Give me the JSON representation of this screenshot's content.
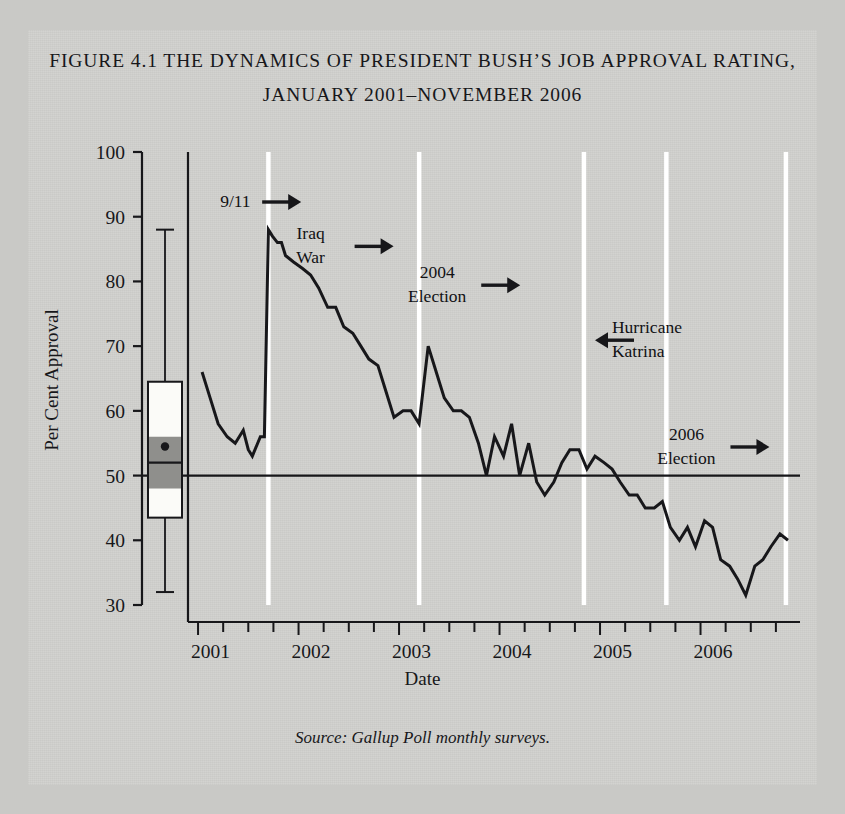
{
  "figure": {
    "title_line_1": "FIGURE 4.1 THE DYNAMICS OF PRESIDENT BUSH’S JOB APPROVAL RATING,",
    "title_line_2": "JANUARY 2001–NOVEMBER 2006",
    "axis_title": "Date",
    "source_note": "Source: Gallup Poll monthly surveys.",
    "background_color": "#d2d2cf",
    "ink_color": "#17171a"
  },
  "chart_data": {
    "type": "line",
    "title": "FIGURE 4.1 THE DYNAMICS OF PRESIDENT BUSH’S JOB APPROVAL RATING, JANUARY 2001–NOVEMBER 2006",
    "xlabel": "Date",
    "ylabel": "Per Cent Approval",
    "ylim": [
      30,
      100
    ],
    "yticks": [
      30,
      40,
      50,
      60,
      70,
      80,
      90,
      100
    ],
    "xlim": [
      2000.9,
      2006.95
    ],
    "xticks": [
      2001,
      2002,
      2003,
      2004,
      2005,
      2006
    ],
    "xtick_labels": [
      "2001",
      "2002",
      "2003",
      "2004",
      "2005",
      "2006"
    ],
    "minor_tick_interval_years": 0.25,
    "grid": false,
    "legend": null,
    "reference_lines": [
      {
        "name": "fifty-per-cent-line",
        "orientation": "horizontal",
        "value": 50,
        "color": "#17171a"
      }
    ],
    "event_gridlines": [
      {
        "label": "9/11",
        "x": 2001.7,
        "color": "#ffffff"
      },
      {
        "label": "Iraq War",
        "x": 2003.2,
        "color": "#ffffff"
      },
      {
        "label": "2004 Election",
        "x": 2004.84,
        "color": "#ffffff"
      },
      {
        "label": "Hurricane Katrina",
        "x": 2005.66,
        "color": "#ffffff"
      },
      {
        "label": "2006 Election",
        "x": 2006.85,
        "color": "#ffffff"
      }
    ],
    "annotations": [
      {
        "name": "annotation-9-11",
        "lines": [
          "9/11"
        ],
        "arrow": "right",
        "text_x": 2001.22,
        "text_y": 91.5
      },
      {
        "name": "annotation-iraq-war",
        "lines": [
          "Iraq",
          "War"
        ],
        "arrow": "right",
        "text_x": 2002.12,
        "text_y": 86.5
      },
      {
        "name": "annotation-2004-election",
        "lines": [
          "2004",
          "Election"
        ],
        "arrow": "right",
        "text_x": 2003.38,
        "text_y": 80.5
      },
      {
        "name": "annotation-hurricane-katrina",
        "lines": [
          "Hurricane",
          "Katrina"
        ],
        "arrow": "left",
        "text_x": 2004.9,
        "text_y": 72.0
      },
      {
        "name": "annotation-2006-election",
        "lines": [
          "2006",
          "Election"
        ],
        "arrow": "right",
        "text_x": 2005.86,
        "text_y": 55.5
      }
    ],
    "series": [
      {
        "name": "Gallup job approval",
        "color": "#17171a",
        "x": [
          2001.04,
          2001.12,
          2001.2,
          2001.29,
          2001.37,
          2001.45,
          2001.5,
          2001.54,
          2001.62,
          2001.66,
          2001.7,
          2001.74,
          2001.79,
          2001.83,
          2001.87,
          2001.95,
          2002.04,
          2002.12,
          2002.2,
          2002.29,
          2002.37,
          2002.45,
          2002.54,
          2002.62,
          2002.7,
          2002.79,
          2002.87,
          2002.95,
          2003.04,
          2003.12,
          2003.2,
          2003.29,
          2003.37,
          2003.45,
          2003.54,
          2003.62,
          2003.7,
          2003.79,
          2003.87,
          2003.95,
          2004.04,
          2004.12,
          2004.2,
          2004.29,
          2004.37,
          2004.45,
          2004.54,
          2004.62,
          2004.7,
          2004.79,
          2004.87,
          2004.95,
          2005.04,
          2005.12,
          2005.2,
          2005.29,
          2005.37,
          2005.45,
          2005.54,
          2005.62,
          2005.7,
          2005.79,
          2005.87,
          2005.95,
          2006.04,
          2006.12,
          2006.2,
          2006.29,
          2006.37,
          2006.45,
          2006.54,
          2006.62,
          2006.7,
          2006.79,
          2006.87
        ],
        "values": [
          66,
          62,
          58,
          56,
          55,
          57,
          54,
          53,
          56,
          56,
          88,
          87,
          86,
          86,
          84,
          83,
          82,
          81,
          79,
          76,
          76,
          73,
          72,
          70,
          68,
          67,
          63,
          59,
          60,
          60,
          58,
          70,
          66,
          62,
          60,
          60,
          59,
          55,
          50,
          56,
          53,
          58,
          50,
          55,
          49,
          47,
          49,
          52,
          54,
          54,
          51,
          53,
          52,
          51,
          49,
          47,
          47,
          45,
          45,
          46,
          42,
          40,
          42,
          39,
          43,
          42,
          37,
          36,
          34,
          31.5,
          36,
          37,
          39,
          41,
          40
        ]
      }
    ],
    "boxplot": {
      "name": "approval-distribution-boxplot",
      "whisker_low": 32,
      "whisker_high": 88,
      "q1": 43.5,
      "q3": 64.5,
      "median": 52,
      "mean": 54.5,
      "shaded_band_low": 48,
      "shaded_band_high": 56,
      "box_fill_color": "#fbfbf8",
      "band_fill_color": "#8f8f8c",
      "outline_color": "#17171a"
    }
  }
}
